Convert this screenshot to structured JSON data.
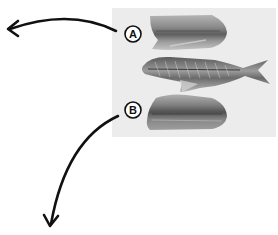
{
  "figure": {
    "photo_background": "#ececec",
    "labels": [
      {
        "id": "A",
        "text": "A",
        "target": "upper-fillet"
      },
      {
        "id": "B",
        "text": "B",
        "target": "lower-fillet"
      }
    ],
    "arrows": [
      {
        "from": "A",
        "direction": "left"
      },
      {
        "from": "B",
        "direction": "down"
      }
    ],
    "parts": [
      {
        "name": "upper-fillet"
      },
      {
        "name": "fish-skeleton"
      },
      {
        "name": "lower-fillet"
      }
    ],
    "colors": {
      "ink": "#111111",
      "fillet_dark": "#6e6e6e",
      "fillet_light": "#a8a8a8",
      "photo_bg": "#ececec"
    }
  }
}
